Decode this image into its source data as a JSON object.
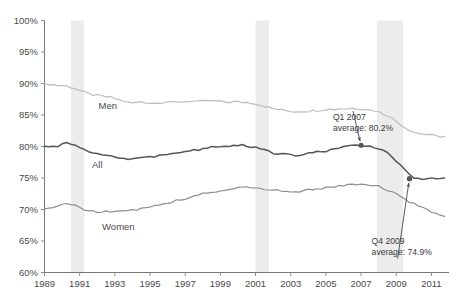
{
  "chart_data": {
    "type": "line",
    "title": "",
    "subtitle": "",
    "xlabel": "",
    "ylabel": "",
    "xlim": [
      1989,
      2012
    ],
    "ylim": [
      60,
      100
    ],
    "grid": false,
    "legend_position": "inline-labels",
    "y_ticks": [
      "60%",
      "65%",
      "70%",
      "75%",
      "80%",
      "85%",
      "90%",
      "95%",
      "100%"
    ],
    "y_tick_values": [
      60,
      65,
      70,
      75,
      80,
      85,
      90,
      95,
      100
    ],
    "x_ticks": [
      "1989",
      "1991",
      "1993",
      "1995",
      "1997",
      "1999",
      "2001",
      "2003",
      "2005",
      "2007",
      "2009",
      "2011"
    ],
    "x_tick_values": [
      1989,
      1991,
      1993,
      1995,
      1997,
      1999,
      2001,
      2003,
      2005,
      2007,
      2009,
      2011
    ],
    "series": [
      {
        "name": "Men",
        "color": "#bdbdbd",
        "label": "Men",
        "label_x": 1992.6,
        "label_y": 86.0,
        "x": [
          1989.0,
          1989.25,
          1989.5,
          1989.75,
          1990.0,
          1990.25,
          1990.5,
          1990.75,
          1991.0,
          1991.25,
          1991.5,
          1991.75,
          1992.0,
          1992.25,
          1992.5,
          1992.75,
          1993.0,
          1993.25,
          1993.5,
          1993.75,
          1994.0,
          1994.25,
          1994.5,
          1994.75,
          1995.0,
          1995.25,
          1995.5,
          1995.75,
          1996.0,
          1996.25,
          1996.5,
          1996.75,
          1997.0,
          1997.25,
          1997.5,
          1997.75,
          1998.0,
          1998.25,
          1998.5,
          1998.75,
          1999.0,
          1999.25,
          1999.5,
          1999.75,
          2000.0,
          2000.25,
          2000.5,
          2000.75,
          2001.0,
          2001.25,
          2001.5,
          2001.75,
          2002.0,
          2002.25,
          2002.5,
          2002.75,
          2003.0,
          2003.25,
          2003.5,
          2003.75,
          2004.0,
          2004.25,
          2004.5,
          2004.75,
          2005.0,
          2005.25,
          2005.5,
          2005.75,
          2006.0,
          2006.25,
          2006.5,
          2006.75,
          2007.0,
          2007.25,
          2007.5,
          2007.75,
          2008.0,
          2008.25,
          2008.5,
          2008.75,
          2009.0,
          2009.25,
          2009.5,
          2009.75,
          2010.0,
          2010.25,
          2010.5,
          2010.75,
          2011.0,
          2011.25,
          2011.5,
          2011.75
        ],
        "values": [
          89.9,
          89.9,
          89.8,
          89.7,
          89.7,
          89.6,
          89.4,
          89.2,
          88.9,
          88.6,
          88.4,
          88.2,
          88.1,
          88.0,
          87.9,
          87.8,
          87.6,
          87.4,
          87.2,
          87.0,
          86.9,
          87.0,
          87.1,
          87.0,
          86.9,
          86.9,
          87.0,
          87.0,
          87.1,
          87.0,
          87.0,
          87.1,
          87.1,
          87.2,
          87.2,
          87.1,
          87.2,
          87.3,
          87.2,
          87.2,
          87.1,
          87.1,
          87.0,
          87.1,
          87.1,
          87.0,
          87.0,
          86.9,
          86.8,
          86.6,
          86.4,
          86.2,
          86.0,
          85.9,
          85.8,
          85.7,
          85.6,
          85.5,
          85.6,
          85.6,
          85.6,
          85.7,
          85.7,
          85.8,
          85.9,
          85.9,
          85.9,
          86.0,
          86.0,
          86.0,
          86.1,
          86.0,
          86.0,
          85.9,
          85.8,
          85.7,
          85.5,
          85.2,
          84.9,
          84.5,
          84.0,
          83.5,
          83.0,
          82.6,
          82.3,
          82.1,
          82.0,
          81.9,
          81.8,
          81.7,
          81.6,
          81.6
        ]
      },
      {
        "name": "All",
        "color": "#565656",
        "label": "All",
        "label_x": 1992.0,
        "label_y": 76.6,
        "x": [
          1989.0,
          1989.25,
          1989.5,
          1989.75,
          1990.0,
          1990.25,
          1990.5,
          1990.75,
          1991.0,
          1991.25,
          1991.5,
          1991.75,
          1992.0,
          1992.25,
          1992.5,
          1992.75,
          1993.0,
          1993.25,
          1993.5,
          1993.75,
          1994.0,
          1994.25,
          1994.5,
          1994.75,
          1995.0,
          1995.25,
          1995.5,
          1995.75,
          1996.0,
          1996.25,
          1996.5,
          1996.75,
          1997.0,
          1997.25,
          1997.5,
          1997.75,
          1998.0,
          1998.25,
          1998.5,
          1998.75,
          1999.0,
          1999.25,
          1999.5,
          1999.75,
          2000.0,
          2000.25,
          2000.5,
          2000.75,
          2001.0,
          2001.25,
          2001.5,
          2001.75,
          2002.0,
          2002.25,
          2002.5,
          2002.75,
          2003.0,
          2003.25,
          2003.5,
          2003.75,
          2004.0,
          2004.25,
          2004.5,
          2004.75,
          2005.0,
          2005.25,
          2005.5,
          2005.75,
          2006.0,
          2006.25,
          2006.5,
          2006.75,
          2007.0,
          2007.25,
          2007.5,
          2007.75,
          2008.0,
          2008.25,
          2008.5,
          2008.75,
          2009.0,
          2009.25,
          2009.5,
          2009.75,
          2010.0,
          2010.25,
          2010.5,
          2010.75,
          2011.0,
          2011.25,
          2011.5,
          2011.75
        ],
        "values": [
          79.9,
          79.9,
          80.0,
          80.1,
          80.3,
          80.5,
          80.4,
          80.2,
          79.9,
          79.6,
          79.3,
          79.1,
          78.9,
          78.7,
          78.6,
          78.5,
          78.3,
          78.2,
          78.2,
          78.1,
          78.1,
          78.2,
          78.3,
          78.3,
          78.3,
          78.4,
          78.5,
          78.6,
          78.7,
          78.8,
          78.9,
          79.0,
          79.1,
          79.2,
          79.4,
          79.5,
          79.7,
          79.8,
          79.9,
          80.0,
          80.1,
          80.1,
          80.1,
          80.2,
          80.2,
          80.2,
          80.1,
          80.0,
          79.9,
          79.7,
          79.4,
          79.2,
          79.0,
          78.9,
          78.8,
          78.7,
          78.6,
          78.6,
          78.7,
          78.8,
          78.9,
          79.0,
          79.1,
          79.2,
          79.3,
          79.5,
          79.7,
          79.8,
          80.0,
          80.1,
          80.2,
          80.2,
          80.2,
          80.1,
          80.0,
          79.9,
          79.7,
          79.3,
          78.9,
          78.4,
          77.7,
          77.0,
          76.3,
          75.6,
          75.1,
          74.9,
          74.9,
          74.8,
          74.9,
          75.0,
          74.9,
          75.0
        ]
      },
      {
        "name": "Women",
        "color": "#8e8e8e",
        "label": "Women",
        "label_x": 1993.2,
        "label_y": 66.8,
        "x": [
          1989.0,
          1989.25,
          1989.5,
          1989.75,
          1990.0,
          1990.25,
          1990.5,
          1990.75,
          1991.0,
          1991.25,
          1991.5,
          1991.75,
          1992.0,
          1992.25,
          1992.5,
          1992.75,
          1993.0,
          1993.25,
          1993.5,
          1993.75,
          1994.0,
          1994.25,
          1994.5,
          1994.75,
          1995.0,
          1995.25,
          1995.5,
          1995.75,
          1996.0,
          1996.25,
          1996.5,
          1996.75,
          1997.0,
          1997.25,
          1997.5,
          1997.75,
          1998.0,
          1998.25,
          1998.5,
          1998.75,
          1999.0,
          1999.25,
          1999.5,
          1999.75,
          2000.0,
          2000.25,
          2000.5,
          2000.75,
          2001.0,
          2001.25,
          2001.5,
          2001.75,
          2002.0,
          2002.25,
          2002.5,
          2002.75,
          2003.0,
          2003.25,
          2003.5,
          2003.75,
          2004.0,
          2004.25,
          2004.5,
          2004.75,
          2005.0,
          2005.25,
          2005.5,
          2005.75,
          2006.0,
          2006.25,
          2006.5,
          2006.75,
          2007.0,
          2007.25,
          2007.5,
          2007.75,
          2008.0,
          2008.25,
          2008.5,
          2008.75,
          2009.0,
          2009.25,
          2009.5,
          2009.75,
          2010.0,
          2010.25,
          2010.5,
          2010.75,
          2011.0,
          2011.25,
          2011.5,
          2011.75
        ],
        "values": [
          70.2,
          70.3,
          70.4,
          70.5,
          70.7,
          70.9,
          70.8,
          70.6,
          70.3,
          70.0,
          69.8,
          69.7,
          69.6,
          69.6,
          69.7,
          69.7,
          69.6,
          69.7,
          69.8,
          69.8,
          69.9,
          70.0,
          70.1,
          70.2,
          70.3,
          70.5,
          70.7,
          70.8,
          71.0,
          71.2,
          71.4,
          71.5,
          71.7,
          71.9,
          72.1,
          72.3,
          72.5,
          72.7,
          72.8,
          72.9,
          73.0,
          73.1,
          73.2,
          73.4,
          73.5,
          73.6,
          73.6,
          73.5,
          73.4,
          73.3,
          73.2,
          73.1,
          73.0,
          73.0,
          72.9,
          72.9,
          72.8,
          72.8,
          72.9,
          73.0,
          73.1,
          73.1,
          73.2,
          73.3,
          73.4,
          73.5,
          73.6,
          73.7,
          73.8,
          73.9,
          74.0,
          74.0,
          74.0,
          73.9,
          73.9,
          73.8,
          73.7,
          73.4,
          73.1,
          72.8,
          72.4,
          72.0,
          71.6,
          71.2,
          70.9,
          70.6,
          70.3,
          70.0,
          69.6,
          69.3,
          69.0,
          68.8
        ]
      }
    ],
    "recession_bands": [
      {
        "name": "recession-1990-1991",
        "start": 1990.5,
        "end": 1991.25
      },
      {
        "name": "recession-2001",
        "start": 2001.0,
        "end": 2001.75
      },
      {
        "name": "recession-2007-2009",
        "start": 2007.9,
        "end": 2009.4
      }
    ],
    "annotations": [
      {
        "name": "annotation-q1-2007",
        "line1": "Q1 2007",
        "line2": "average: 80.2%",
        "text_x": 2005.4,
        "text_y": 84.2,
        "point_x": 2007.0,
        "point_y": 80.2,
        "series": "All"
      },
      {
        "name": "annotation-q4-2009",
        "line1": "Q4 2009",
        "line2": "average: 74.9%",
        "text_x": 2007.6,
        "text_y": 64.6,
        "point_x": 2009.75,
        "point_y": 74.9,
        "series": "All"
      }
    ],
    "note": ""
  },
  "colors": {
    "men": "#bdbdbd",
    "all": "#565656",
    "women": "#8e8e8e",
    "recession_band": "#ececec",
    "axis": "#777777",
    "text": "#4a4a4a",
    "background": "#ffffff"
  }
}
